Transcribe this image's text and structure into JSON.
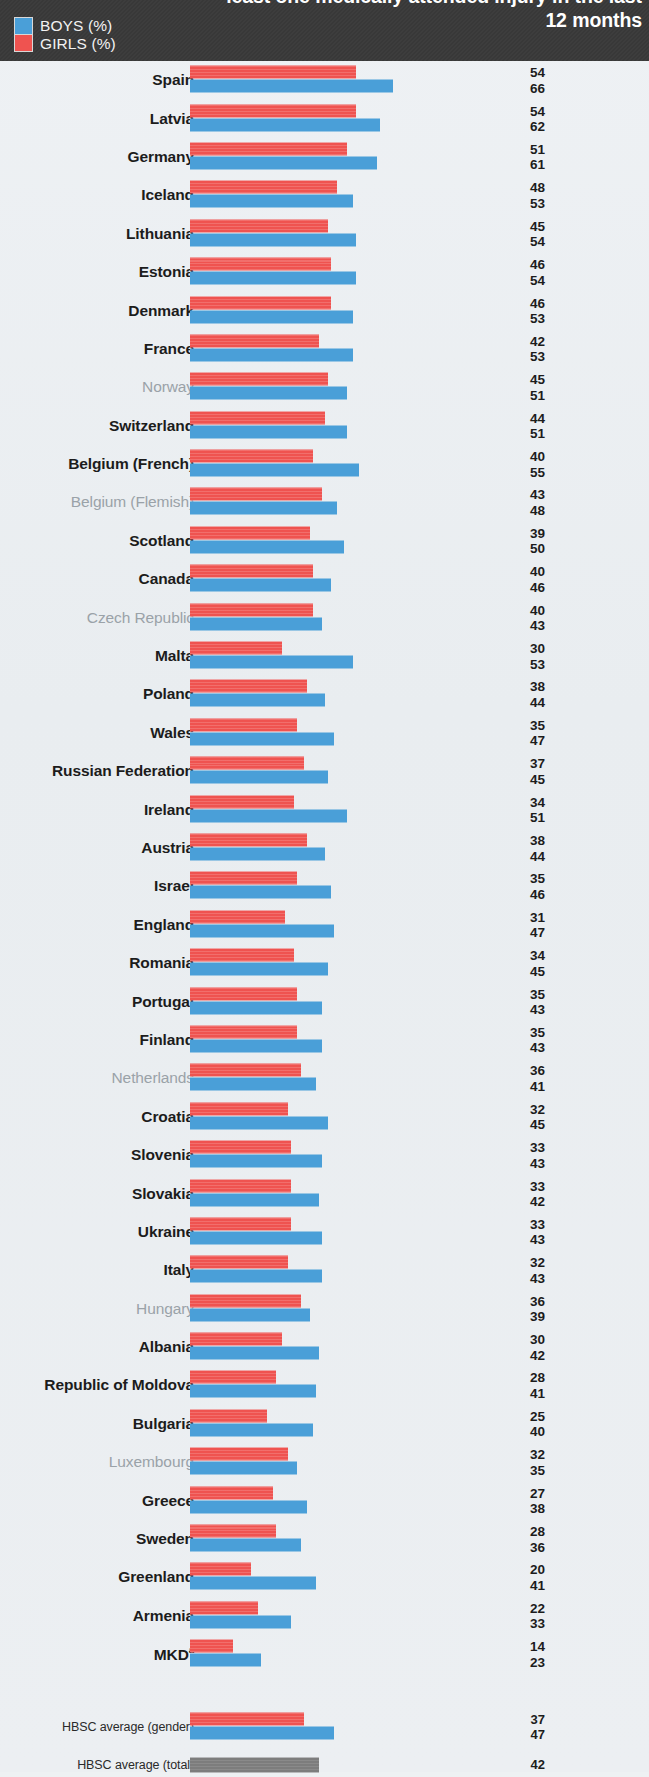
{
  "header": {
    "title": "least one medically attended injury in the last 12 months",
    "legend": [
      {
        "key": "boys",
        "label": "BOYS (%)",
        "color": "#4a9fd8"
      },
      {
        "key": "girls",
        "label": "GIRLS (%)",
        "color": "#ef5350"
      }
    ]
  },
  "chart_data": {
    "type": "bar",
    "orientation": "horizontal",
    "title": "least one medically attended injury in the last 12 months",
    "xlabel": "",
    "ylabel": "",
    "xlim": [
      0,
      70
    ],
    "grid": false,
    "legend_position": "top-left",
    "legend": [
      "BOYS (%)",
      "GIRLS (%)"
    ],
    "series": [
      {
        "name": "GIRLS (%)",
        "color": "#ef5350",
        "values": [
          54,
          54,
          51,
          48,
          45,
          46,
          46,
          42,
          45,
          44,
          40,
          43,
          39,
          40,
          40,
          30,
          38,
          35,
          37,
          34,
          38,
          35,
          31,
          34,
          35,
          35,
          36,
          32,
          33,
          33,
          33,
          32,
          36,
          30,
          28,
          25,
          32,
          27,
          28,
          20,
          22,
          14
        ]
      },
      {
        "name": "BOYS (%)",
        "color": "#4a9fd8",
        "values": [
          66,
          62,
          61,
          53,
          54,
          54,
          53,
          53,
          51,
          51,
          55,
          48,
          50,
          46,
          43,
          53,
          44,
          47,
          45,
          51,
          44,
          46,
          47,
          45,
          43,
          43,
          41,
          45,
          43,
          42,
          43,
          43,
          39,
          42,
          41,
          40,
          35,
          38,
          36,
          41,
          33,
          23
        ]
      }
    ],
    "categories": [
      "Spain",
      "Latvia",
      "Germany",
      "Iceland",
      "Lithuania",
      "Estonia",
      "Denmark",
      "France",
      "Norway",
      "Switzerland",
      "Belgium (French)",
      "Belgium (Flemish)",
      "Scotland",
      "Canada",
      "Czech Republic",
      "Malta",
      "Poland",
      "Wales",
      "Russian Federation",
      "Ireland",
      "Austria",
      "Israel",
      "England",
      "Romania",
      "Portugal",
      "Finland",
      "Netherlands",
      "Croatia",
      "Slovenia",
      "Slovakia",
      "Ukraine",
      "Italy",
      "Hungary",
      "Albania",
      "Republic of Moldova",
      "Bulgaria",
      "Luxembourg",
      "Greece",
      "Sweden",
      "Greenland",
      "Armenia",
      "MKD"
    ],
    "averages": [
      {
        "label": "HBSC average (gender)",
        "girls": 37,
        "boys": 47
      },
      {
        "label": "HBSC average (total)",
        "total": 42,
        "color": "#7d7d7d"
      }
    ]
  },
  "rows": [
    {
      "country": "Spain",
      "girls": 54,
      "boys": 66,
      "muted": false
    },
    {
      "country": "Latvia",
      "girls": 54,
      "boys": 62,
      "muted": false
    },
    {
      "country": "Germany",
      "girls": 51,
      "boys": 61,
      "muted": false
    },
    {
      "country": "Iceland",
      "girls": 48,
      "boys": 53,
      "muted": false
    },
    {
      "country": "Lithuania",
      "girls": 45,
      "boys": 54,
      "muted": false
    },
    {
      "country": "Estonia",
      "girls": 46,
      "boys": 54,
      "muted": false
    },
    {
      "country": "Denmark",
      "girls": 46,
      "boys": 53,
      "muted": false
    },
    {
      "country": "France",
      "girls": 42,
      "boys": 53,
      "muted": false
    },
    {
      "country": "Norway",
      "girls": 45,
      "boys": 51,
      "muted": true
    },
    {
      "country": "Switzerland",
      "girls": 44,
      "boys": 51,
      "muted": false
    },
    {
      "country": "Belgium (French)",
      "girls": 40,
      "boys": 55,
      "muted": false
    },
    {
      "country": "Belgium (Flemish)",
      "girls": 43,
      "boys": 48,
      "muted": true
    },
    {
      "country": "Scotland",
      "girls": 39,
      "boys": 50,
      "muted": false
    },
    {
      "country": "Canada",
      "girls": 40,
      "boys": 46,
      "muted": false
    },
    {
      "country": "Czech Republic",
      "girls": 40,
      "boys": 43,
      "muted": true
    },
    {
      "country": "Malta",
      "girls": 30,
      "boys": 53,
      "muted": false
    },
    {
      "country": "Poland",
      "girls": 38,
      "boys": 44,
      "muted": false
    },
    {
      "country": "Wales",
      "girls": 35,
      "boys": 47,
      "muted": false
    },
    {
      "country": "Russian Federation",
      "girls": 37,
      "boys": 45,
      "muted": false
    },
    {
      "country": "Ireland",
      "girls": 34,
      "boys": 51,
      "muted": false
    },
    {
      "country": "Austria",
      "girls": 38,
      "boys": 44,
      "muted": false
    },
    {
      "country": "Israel",
      "girls": 35,
      "boys": 46,
      "muted": false
    },
    {
      "country": "England",
      "girls": 31,
      "boys": 47,
      "muted": false
    },
    {
      "country": "Romania",
      "girls": 34,
      "boys": 45,
      "muted": false
    },
    {
      "country": "Portugal",
      "girls": 35,
      "boys": 43,
      "muted": false
    },
    {
      "country": "Finland",
      "girls": 35,
      "boys": 43,
      "muted": false
    },
    {
      "country": "Netherlands",
      "girls": 36,
      "boys": 41,
      "muted": true
    },
    {
      "country": "Croatia",
      "girls": 32,
      "boys": 45,
      "muted": false
    },
    {
      "country": "Slovenia",
      "girls": 33,
      "boys": 43,
      "muted": false
    },
    {
      "country": "Slovakia",
      "girls": 33,
      "boys": 42,
      "muted": false
    },
    {
      "country": "Ukraine",
      "girls": 33,
      "boys": 43,
      "muted": false
    },
    {
      "country": "Italy",
      "girls": 32,
      "boys": 43,
      "muted": false
    },
    {
      "country": "Hungary",
      "girls": 36,
      "boys": 39,
      "muted": true
    },
    {
      "country": "Albania",
      "girls": 30,
      "boys": 42,
      "muted": false
    },
    {
      "country": "Republic of Moldova",
      "girls": 28,
      "boys": 41,
      "muted": false
    },
    {
      "country": "Bulgaria",
      "girls": 25,
      "boys": 40,
      "muted": false
    },
    {
      "country": "Luxembourg",
      "girls": 32,
      "boys": 35,
      "muted": true
    },
    {
      "country": "Greece",
      "girls": 27,
      "boys": 38,
      "muted": false
    },
    {
      "country": "Sweden",
      "girls": 28,
      "boys": 36,
      "muted": false
    },
    {
      "country": "Greenland",
      "girls": 20,
      "boys": 41,
      "muted": false
    },
    {
      "country": "Armenia",
      "girls": 22,
      "boys": 33,
      "muted": false
    },
    {
      "country": "MKD",
      "girls": 14,
      "boys": 23,
      "muted": false,
      "footnote": "a"
    }
  ],
  "averages": [
    {
      "label": "HBSC average (gender)",
      "girls": 37,
      "boys": 47
    },
    {
      "label": "HBSC average (total)",
      "total": 42
    }
  ]
}
